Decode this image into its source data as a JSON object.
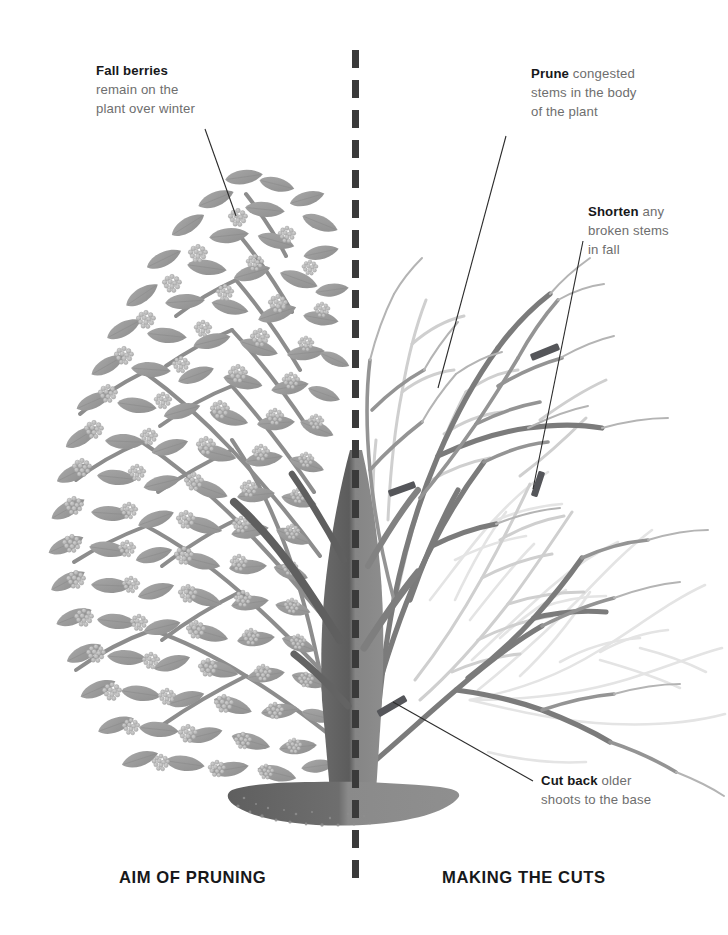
{
  "illustration": {
    "subject": "deciduous berrying shrub, split comparison diagram",
    "palette": {
      "leaf": "#9a9a9a",
      "leaf_dark": "#8a8a8a",
      "berry": "#b9b9b9",
      "stem_dark": "#6f6f6f",
      "stem_mid": "#8f8f8f",
      "stem_light": "#c9c9c9",
      "stem_ghost": "#e2e2e2",
      "trunk": "#7a7a7a",
      "trunk_shadow": "#5e5e5e",
      "soil": "#6d6d6d",
      "soil_light": "#8c8c8c",
      "cut_mark": "#55565a",
      "divider": "#3a3a3a",
      "leader": "#2b2b2b",
      "text_bold": "#17181a",
      "text_body": "#6e6e6e",
      "background": "#ffffff"
    }
  },
  "labels": {
    "fall_berries": {
      "bold": "Fall berries",
      "rest": "remain on the\nplant over winter"
    },
    "prune": {
      "bold": "Prune",
      "rest": " congested\nstems in the body\nof the plant"
    },
    "shorten": {
      "bold": "Shorten",
      "rest": " any\nbroken stems\nin fall"
    },
    "cut_back": {
      "bold": "Cut back",
      "rest": " older\nshoots to the base"
    }
  },
  "captions": {
    "left": "AIM OF PRUNING",
    "right": "MAKING THE CUTS"
  },
  "cut_marks": [
    {
      "name": "cut-mark-upper-right",
      "x": 545,
      "y": 352,
      "angle": -22
    },
    {
      "name": "cut-mark-mid-right",
      "x": 538,
      "y": 484,
      "angle": -70
    },
    {
      "name": "cut-mark-lower-left",
      "x": 402,
      "y": 489,
      "angle": -22
    },
    {
      "name": "cut-mark-base",
      "x": 392,
      "y": 706,
      "angle": -28
    }
  ],
  "leader_lines": [
    {
      "name": "leader-fall-berries",
      "x1": 205,
      "y1": 129,
      "x2": 236,
      "y2": 216
    },
    {
      "name": "leader-prune",
      "x1": 506,
      "y1": 136,
      "x2": 438,
      "y2": 388
    },
    {
      "name": "leader-shorten",
      "x1": 583,
      "y1": 241,
      "x2": 533,
      "y2": 489
    },
    {
      "name": "leader-cut-back",
      "x1": 533,
      "y1": 781,
      "x2": 393,
      "y2": 702
    }
  ]
}
